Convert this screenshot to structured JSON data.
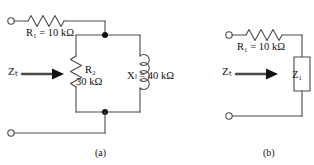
{
  "figure": {
    "captions": {
      "a": "(a)",
      "b": "(b)"
    }
  },
  "circuit_a": {
    "labels": {
      "r1": "R₁ = 10 kΩ",
      "r2_name": "R₂",
      "r2_value": "30 kΩ",
      "xl": "Xₗ = 40 kΩ",
      "zt": "Zₜ"
    },
    "components": [
      {
        "name": "R1",
        "type": "resistor",
        "value": "10 kΩ",
        "orientation": "horizontal"
      },
      {
        "name": "R2",
        "type": "resistor",
        "value": "30 kΩ",
        "orientation": "vertical"
      },
      {
        "name": "XL",
        "type": "inductor",
        "value": "40 kΩ",
        "orientation": "vertical"
      }
    ],
    "topology": "R1 in series with parallel combination of R2 and XL",
    "input_arrow": "Zₜ"
  },
  "circuit_b": {
    "labels": {
      "r1": "R₁ = 10 kΩ",
      "zt": "Zₜ",
      "z1": "Z₁"
    },
    "components": [
      {
        "name": "R1",
        "type": "resistor",
        "value": "10 kΩ",
        "orientation": "horizontal"
      },
      {
        "name": "Z1",
        "type": "impedance-block",
        "value": "Z₁",
        "orientation": "vertical"
      }
    ],
    "topology": "R1 in series with impedance block Z1",
    "input_arrow": "Zₜ"
  },
  "colors": {
    "line": "#4a4a4a",
    "text": "#111111",
    "background": "#ffffff",
    "node": "#111111"
  }
}
